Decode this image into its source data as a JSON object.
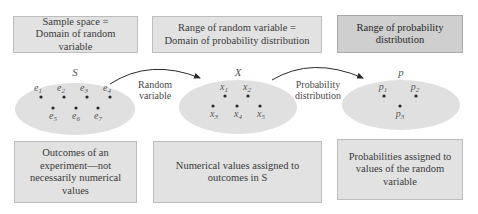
{
  "top_boxes": [
    {
      "text": "Sample space =\nDomain of random variable"
    },
    {
      "text": "Range of random variable =\nDomain of probability distribution"
    },
    {
      "text": "Range of probability\ndistribution"
    }
  ],
  "sets": [
    {
      "name": "S",
      "points": [
        {
          "label": "e",
          "sub": "1"
        },
        {
          "label": "e",
          "sub": "2"
        },
        {
          "label": "e",
          "sub": "3"
        },
        {
          "label": "e",
          "sub": "4"
        },
        {
          "label": "e",
          "sub": "5"
        },
        {
          "label": "e",
          "sub": "6"
        },
        {
          "label": "e",
          "sub": "7"
        }
      ]
    },
    {
      "name": "X",
      "points": [
        {
          "label": "x",
          "sub": "1"
        },
        {
          "label": "x",
          "sub": "2"
        },
        {
          "label": "x",
          "sub": "3"
        },
        {
          "label": "x",
          "sub": "4"
        },
        {
          "label": "x",
          "sub": "5"
        }
      ]
    },
    {
      "name": "p",
      "points": [
        {
          "label": "p",
          "sub": "1"
        },
        {
          "label": "p",
          "sub": "2"
        },
        {
          "label": "p",
          "sub": "3"
        }
      ]
    }
  ],
  "arrows": [
    {
      "line1": "Random",
      "line2": "variable"
    },
    {
      "line1": "Probability",
      "line2": "distribution"
    }
  ],
  "bottom_boxes": [
    {
      "text": "Outcomes of an\nexperiment—not\nnecessarily numerical\nvalues"
    },
    {
      "text": "Numerical values assigned to\noutcomes in S"
    },
    {
      "text": "Probabilities assigned to\nvalues of the random\nvariable"
    }
  ],
  "colors": {
    "box_fill": "#e2e2e2",
    "box_fill_dark": "#cfcfcf",
    "ellipse_fill": "#e0e0e0",
    "arrow": "#2a2a2a",
    "dot": "#2a2a2a"
  }
}
